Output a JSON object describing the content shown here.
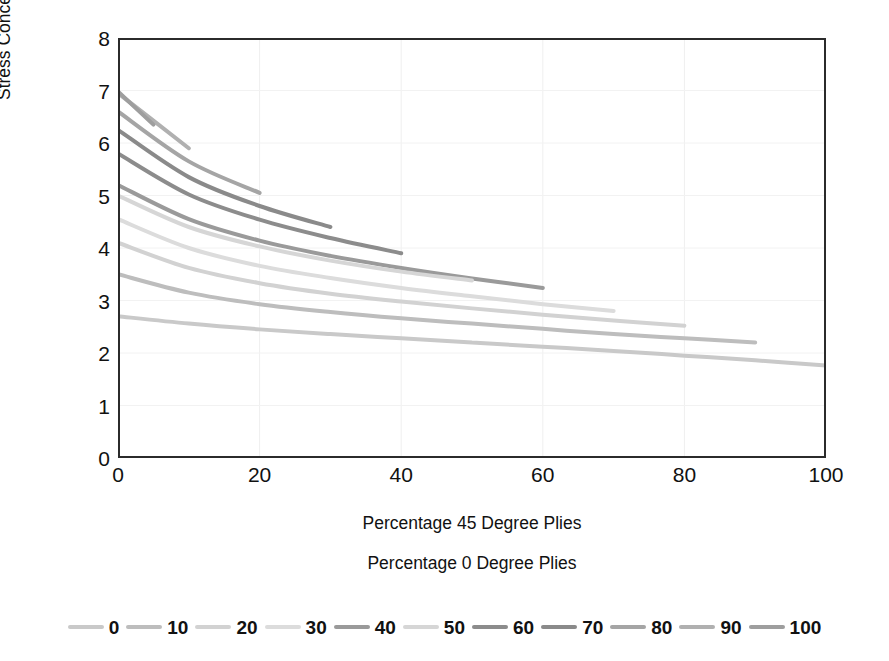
{
  "chart_data": {
    "type": "line",
    "title": "",
    "xlabel": "Percentage 45 Degree Plies",
    "ylabel": "Stress Concentration Factor",
    "legend_title": "Percentage 0 Degree Plies",
    "legend_position": "bottom",
    "grid": true,
    "xlim": [
      0,
      100
    ],
    "ylim": [
      0,
      8
    ],
    "xticks": [
      "0",
      "20",
      "40",
      "60",
      "80",
      "100"
    ],
    "xtick_values": [
      0,
      20,
      40,
      60,
      80,
      100
    ],
    "yticks": [
      "0",
      "1",
      "2",
      "3",
      "4",
      "5",
      "6",
      "7",
      "8"
    ],
    "ytick_values": [
      0,
      1,
      2,
      3,
      4,
      5,
      6,
      7,
      8
    ],
    "series": [
      {
        "name": "0",
        "color": "#c9c9c9",
        "x": [
          0,
          10,
          20,
          30,
          40,
          50,
          60,
          70,
          80,
          90,
          100
        ],
        "values": [
          2.7,
          2.56,
          2.45,
          2.36,
          2.28,
          2.2,
          2.12,
          2.04,
          1.95,
          1.86,
          1.76
        ]
      },
      {
        "name": "10",
        "color": "#bdbdbd",
        "x": [
          0,
          10,
          20,
          30,
          40,
          50,
          60,
          70,
          80,
          90
        ],
        "values": [
          3.5,
          3.15,
          2.93,
          2.78,
          2.66,
          2.56,
          2.46,
          2.36,
          2.28,
          2.2
        ]
      },
      {
        "name": "20",
        "color": "#d2d2d2",
        "x": [
          0,
          10,
          20,
          30,
          40,
          50,
          60,
          70,
          80
        ],
        "values": [
          4.1,
          3.62,
          3.33,
          3.13,
          2.98,
          2.85,
          2.73,
          2.62,
          2.52
        ]
      },
      {
        "name": "30",
        "color": "#dcdcdc",
        "x": [
          0,
          10,
          20,
          30,
          40,
          50,
          60,
          70
        ],
        "values": [
          4.55,
          4.0,
          3.66,
          3.43,
          3.24,
          3.08,
          2.93,
          2.8
        ]
      },
      {
        "name": "40",
        "color": "#9a9a9a",
        "x": [
          0,
          10,
          20,
          30,
          40,
          50,
          60
        ],
        "values": [
          5.2,
          4.55,
          4.14,
          3.85,
          3.62,
          3.42,
          3.24
        ]
      },
      {
        "name": "50",
        "color": "#d6d6d6",
        "x": [
          0,
          10,
          20,
          30,
          40,
          50
        ],
        "values": [
          5.0,
          4.4,
          4.03,
          3.76,
          3.55,
          3.38
        ]
      },
      {
        "name": "60",
        "color": "#8c8c8c",
        "x": [
          0,
          10,
          20,
          30,
          40
        ],
        "values": [
          5.8,
          5.02,
          4.54,
          4.19,
          3.9
        ]
      },
      {
        "name": "70",
        "color": "#8a8a8a",
        "x": [
          0,
          10,
          20,
          30
        ],
        "values": [
          6.25,
          5.35,
          4.8,
          4.4
        ]
      },
      {
        "name": "80",
        "color": "#a5a5a5",
        "x": [
          0,
          10,
          20
        ],
        "values": [
          6.6,
          5.65,
          5.05
        ]
      },
      {
        "name": "90",
        "color": "#b0b0b0",
        "x": [
          0,
          10
        ],
        "values": [
          6.95,
          5.9
        ]
      },
      {
        "name": "100",
        "color": "#9e9e9e",
        "x": [
          0,
          5
        ],
        "values": [
          6.98,
          6.35
        ]
      }
    ]
  }
}
